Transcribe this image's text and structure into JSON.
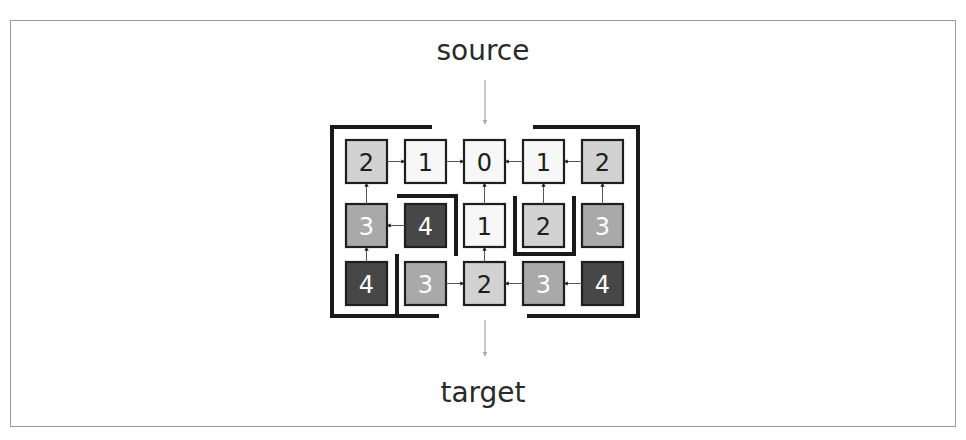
{
  "labels": {
    "source": "source",
    "target": "target"
  },
  "colors": {
    "level_0": "#f7f7f7",
    "level_1": "#f7f7f7",
    "level_2": "#d2d2d2",
    "level_3": "#a9a9a9",
    "level_4": "#474747",
    "wall": "#1a1a1a",
    "flow_arrow": "#a8a8a8",
    "cell_border": "#1e1e1e"
  },
  "grid": {
    "rows": 3,
    "cols": 5,
    "cells": [
      [
        {
          "value": "2"
        },
        {
          "value": "1"
        },
        {
          "value": "0"
        },
        {
          "value": "1"
        },
        {
          "value": "2"
        }
      ],
      [
        {
          "value": "3"
        },
        {
          "value": "4"
        },
        {
          "value": "1"
        },
        {
          "value": "2"
        },
        {
          "value": "3"
        }
      ],
      [
        {
          "value": "4"
        },
        {
          "value": "3"
        },
        {
          "value": "2"
        },
        {
          "value": "3"
        },
        {
          "value": "4"
        }
      ]
    ]
  },
  "edges": [
    {
      "from": [
        0,
        0
      ],
      "to": [
        0,
        1
      ]
    },
    {
      "from": [
        0,
        1
      ],
      "to": [
        0,
        2
      ]
    },
    {
      "from": [
        0,
        3
      ],
      "to": [
        0,
        2
      ]
    },
    {
      "from": [
        0,
        4
      ],
      "to": [
        0,
        3
      ]
    },
    {
      "from": [
        1,
        0
      ],
      "to": [
        0,
        0
      ]
    },
    {
      "from": [
        1,
        1
      ],
      "to": [
        1,
        0
      ]
    },
    {
      "from": [
        1,
        2
      ],
      "to": [
        0,
        2
      ]
    },
    {
      "from": [
        1,
        3
      ],
      "to": [
        0,
        3
      ]
    },
    {
      "from": [
        1,
        4
      ],
      "to": [
        0,
        4
      ]
    },
    {
      "from": [
        2,
        0
      ],
      "to": [
        1,
        0
      ]
    },
    {
      "from": [
        2,
        1
      ],
      "to": [
        2,
        2
      ]
    },
    {
      "from": [
        2,
        2
      ],
      "to": [
        1,
        2
      ]
    },
    {
      "from": [
        2,
        3
      ],
      "to": [
        2,
        2
      ]
    },
    {
      "from": [
        2,
        4
      ],
      "to": [
        2,
        3
      ]
    }
  ]
}
